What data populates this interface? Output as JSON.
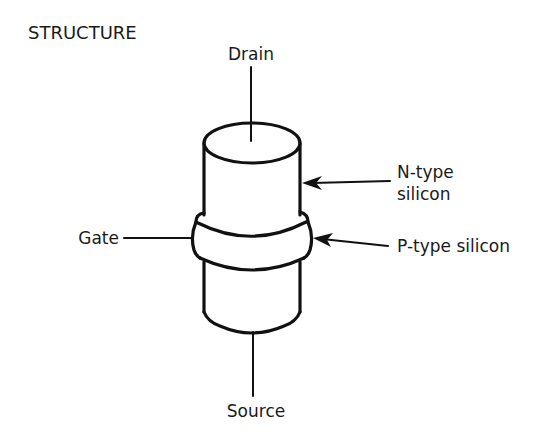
{
  "title": "STRUCTURE",
  "diagram": {
    "type": "transistor-structure",
    "labels": {
      "drain": "Drain",
      "source": "Source",
      "gate": "Gate",
      "n_type_line1": "N-type",
      "n_type_line2": "silicon",
      "p_type": "P-type silicon"
    },
    "components": [
      {
        "name": "N-type silicon cylinder",
        "position": "upper"
      },
      {
        "name": "P-type silicon band",
        "position": "middle",
        "connected_to": "Gate"
      },
      {
        "name": "N-type silicon cylinder",
        "position": "lower"
      }
    ],
    "terminals": [
      "Drain",
      "Gate",
      "Source"
    ],
    "colors": {
      "line": "#111111",
      "background": "#ffffff"
    }
  }
}
